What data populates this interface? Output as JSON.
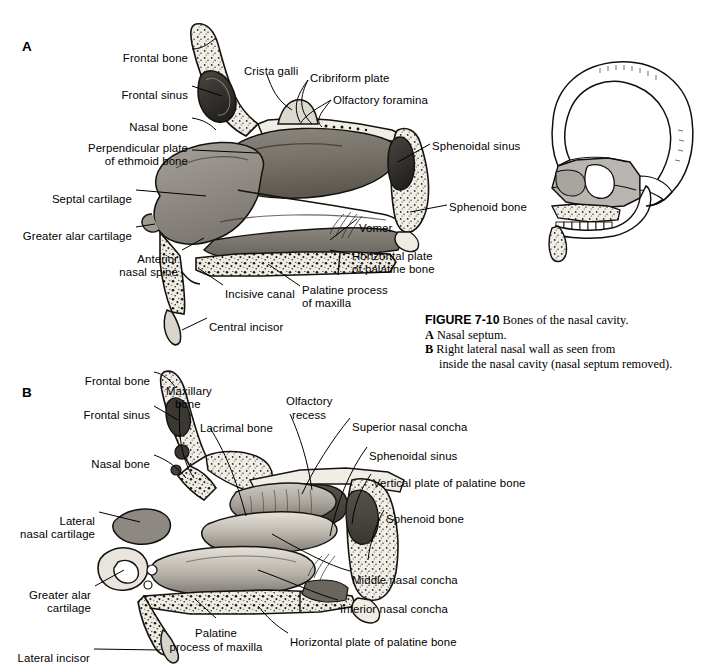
{
  "figure": {
    "number": "FIGURE 7-10",
    "title": "Bones of the nasal cavity.",
    "panels": [
      {
        "letter": "A",
        "text": "Nasal septum."
      },
      {
        "letter": "B",
        "text": "Right lateral nasal wall as seen from",
        "text2": "inside the nasal cavity (nasal septum removed)."
      }
    ]
  },
  "panel_a": {
    "letter": "A",
    "labels": [
      {
        "text": "Frontal bone",
        "x": 188,
        "y": 52,
        "align": "r"
      },
      {
        "text": "Crista galli",
        "x": 244,
        "y": 65,
        "align": "l"
      },
      {
        "text": "Cribriform plate",
        "x": 310,
        "y": 72,
        "align": "l"
      },
      {
        "text": "Olfactory foramina",
        "x": 333,
        "y": 94,
        "align": "l"
      },
      {
        "text": "Frontal sinus",
        "x": 188,
        "y": 89,
        "align": "r"
      },
      {
        "text": "Nasal bone",
        "x": 188,
        "y": 121,
        "align": "r"
      },
      {
        "text": "Perpendicular plate",
        "x": 188,
        "y": 142,
        "align": "r"
      },
      {
        "text": "of ethmoid bone",
        "x": 188,
        "y": 155,
        "align": "r"
      },
      {
        "text": "Sphenoidal sinus",
        "x": 432,
        "y": 140,
        "align": "l"
      },
      {
        "text": "Septal cartilage",
        "x": 132,
        "y": 193,
        "align": "r"
      },
      {
        "text": "Sphenoid bone",
        "x": 449,
        "y": 201,
        "align": "l"
      },
      {
        "text": "Greater alar cartilage",
        "x": 132,
        "y": 230,
        "align": "r"
      },
      {
        "text": "Vomer",
        "x": 359,
        "y": 222,
        "align": "l"
      },
      {
        "text": "Anterior",
        "x": 178,
        "y": 253,
        "align": "r"
      },
      {
        "text": "nasal spine",
        "x": 178,
        "y": 266,
        "align": "r"
      },
      {
        "text": "Horizontal plate",
        "x": 352,
        "y": 250,
        "align": "l"
      },
      {
        "text": "of palatine bone",
        "x": 352,
        "y": 263,
        "align": "l"
      },
      {
        "text": "Incisive canal",
        "x": 225,
        "y": 288,
        "align": "l"
      },
      {
        "text": "Palatine process",
        "x": 302,
        "y": 284,
        "align": "l"
      },
      {
        "text": "of maxilla",
        "x": 302,
        "y": 297,
        "align": "l"
      },
      {
        "text": "Central incisor",
        "x": 209,
        "y": 321,
        "align": "l"
      }
    ]
  },
  "panel_b": {
    "letter": "B",
    "labels": [
      {
        "text": "Frontal bone",
        "x": 150,
        "y": 375,
        "align": "r"
      },
      {
        "text": "Maxillary",
        "x": 166,
        "y": 385,
        "align": "l"
      },
      {
        "text": "bone",
        "x": 175,
        "y": 398,
        "align": "l"
      },
      {
        "text": "Olfactory",
        "x": 286,
        "y": 395,
        "align": "l"
      },
      {
        "text": "recess",
        "x": 292,
        "y": 409,
        "align": "l"
      },
      {
        "text": "Frontal sinus",
        "x": 150,
        "y": 409,
        "align": "r"
      },
      {
        "text": "Lacrimal bone",
        "x": 200,
        "y": 422,
        "align": "l"
      },
      {
        "text": "Superior nasal concha",
        "x": 352,
        "y": 421,
        "align": "l"
      },
      {
        "text": "Sphenoidal sinus",
        "x": 369,
        "y": 450,
        "align": "l"
      },
      {
        "text": "Nasal bone",
        "x": 150,
        "y": 458,
        "align": "r"
      },
      {
        "text": "Vertical plate of palatine bone",
        "x": 373,
        "y": 477,
        "align": "l"
      },
      {
        "text": "Sphenoid bone",
        "x": 386,
        "y": 513,
        "align": "l"
      },
      {
        "text": "Lateral",
        "x": 95,
        "y": 515,
        "align": "r"
      },
      {
        "text": "nasal cartilage",
        "x": 95,
        "y": 528,
        "align": "r"
      },
      {
        "text": "Greater alar",
        "x": 91,
        "y": 589,
        "align": "r"
      },
      {
        "text": "cartilage",
        "x": 91,
        "y": 602,
        "align": "r"
      },
      {
        "text": "Middle nasal concha",
        "x": 352,
        "y": 574,
        "align": "l"
      },
      {
        "text": "Inferior nasal concha",
        "x": 340,
        "y": 603,
        "align": "l"
      },
      {
        "text": "Palatine",
        "x": 216,
        "y": 627,
        "align": "c"
      },
      {
        "text": "process of maxilla",
        "x": 216,
        "y": 641,
        "align": "c"
      },
      {
        "text": "Horizontal plate of palatine bone",
        "x": 290,
        "y": 636,
        "align": "l"
      },
      {
        "text": "Lateral incisor",
        "x": 90,
        "y": 652,
        "align": "r"
      }
    ]
  },
  "inset": {
    "name": "skull-orientation-inset",
    "description": "Lateral view line drawing of skull with nasal region shaded"
  },
  "colors": {
    "ink": "#000000",
    "background": "#ffffff",
    "bone_light": "#f2efe8",
    "bone_mid": "#9b968f",
    "bone_dark": "#5d5a56",
    "cartilage": "#8e8a85",
    "shadow": "#3a3836",
    "inset_shade": "#b8b5b0"
  }
}
